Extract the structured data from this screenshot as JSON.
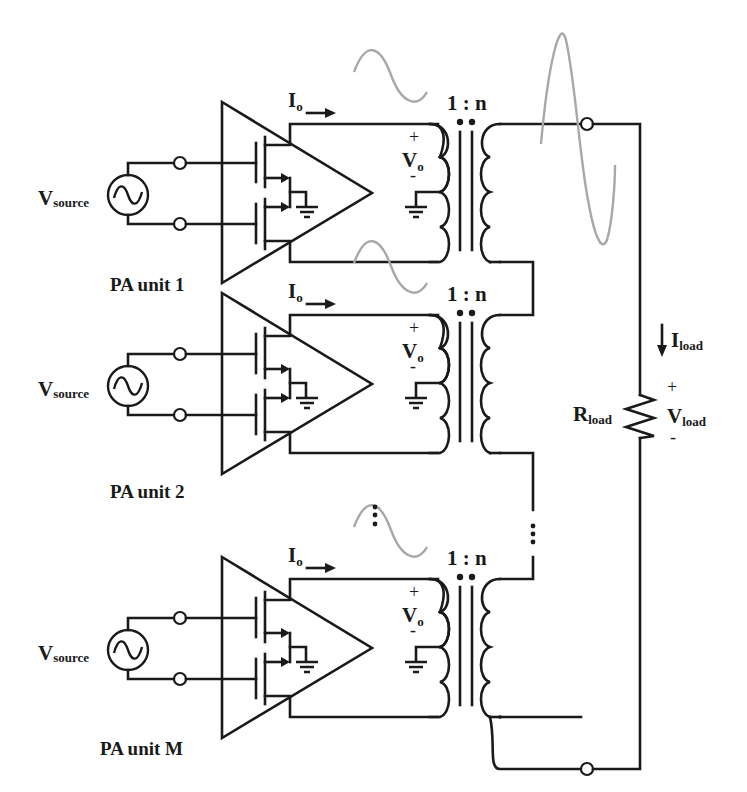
{
  "diagram": {
    "units": [
      {
        "label": "PA unit 1",
        "offset_y": 0
      },
      {
        "label": "PA unit 2",
        "offset_y": 191
      },
      {
        "label": "PA unit M",
        "offset_y": 455
      }
    ],
    "source_label": {
      "main": "V",
      "sub": "source"
    },
    "output_current_label": {
      "main": "I",
      "sub": "o"
    },
    "output_voltage_label": {
      "main": "V",
      "sub": "o",
      "plus": "+",
      "minus": "-"
    },
    "turns_ratio": "1 : n",
    "load_resistor_label": {
      "main": "R",
      "sub": "load"
    },
    "load_current_label": {
      "main": "I",
      "sub": "load"
    },
    "load_voltage_label": {
      "main": "V",
      "sub": "load",
      "plus": "+",
      "minus": "-"
    },
    "ellipsis": "⋮",
    "colors": {
      "wire": "#1a1a1a",
      "waveform": "#a8a8a8",
      "background": "#ffffff"
    }
  }
}
